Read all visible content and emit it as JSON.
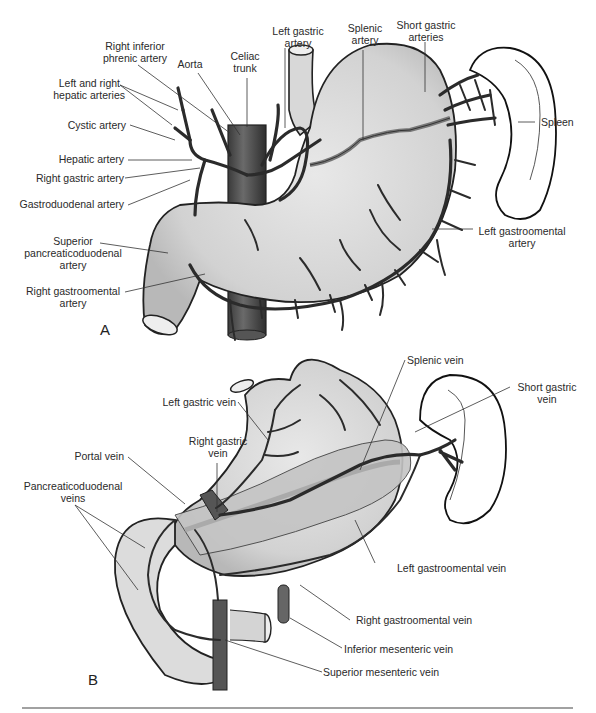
{
  "figure": {
    "panel_a": {
      "letter": "A",
      "labels": {
        "right_inferior_phrenic_artery": [
          "Right inferior",
          "phrenic artery"
        ],
        "aorta": [
          "Aorta"
        ],
        "celiac_trunk": [
          "Celiac",
          "trunk"
        ],
        "left_gastric_artery": [
          "Left gastric",
          "artery"
        ],
        "splenic_artery": [
          "Splenic",
          "artery"
        ],
        "short_gastric_arteries": [
          "Short gastric",
          "arteries"
        ],
        "left_and_right_hepatic_arteries": [
          "Left and right",
          "hepatic arteries"
        ],
        "cystic_artery": [
          "Cystic artery"
        ],
        "hepatic_artery": [
          "Hepatic artery"
        ],
        "right_gastric_artery": [
          "Right gastric artery"
        ],
        "gastroduodenal_artery": [
          "Gastroduodenal artery"
        ],
        "superior_pancreaticoduodenal_artery": [
          "Superior",
          "pancreaticoduodenal",
          "artery"
        ],
        "right_gastroomental_artery": [
          "Right gastroomental",
          "artery"
        ],
        "spleen": [
          "Spleen"
        ],
        "left_gastroomental_artery": [
          "Left gastroomental",
          "artery"
        ]
      }
    },
    "panel_b": {
      "letter": "B",
      "labels": {
        "splenic_vein": [
          "Splenic vein"
        ],
        "short_gastric_vein": [
          "Short gastric",
          "vein"
        ],
        "left_gastric_vein": [
          "Left gastric vein"
        ],
        "right_gastric_vein": [
          "Right gastric",
          "vein"
        ],
        "portal_vein": [
          "Portal vein"
        ],
        "pancreaticoduodenal_veins": [
          "Pancreaticoduodenal",
          "veins"
        ],
        "left_gastroomental_vein": [
          "Left gastroomental vein"
        ],
        "right_gastroomental_vein": [
          "Right gastroomental vein"
        ],
        "inferior_mesenteric_vein": [
          "Inferior mesenteric vein"
        ],
        "superior_mesenteric_vein": [
          "Superior mesenteric vein"
        ]
      }
    }
  }
}
